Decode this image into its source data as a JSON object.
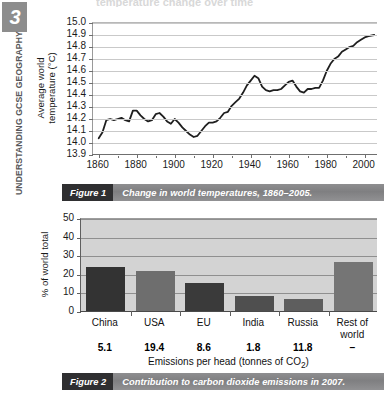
{
  "sidebar": {
    "chapter_number": "3",
    "running_title": "UNDERSTANDING GCSE GEOGRAPHY"
  },
  "top_cut_text": "temperature change over time",
  "figure1": {
    "caption_label": "Figure 1",
    "caption_text": "Change in world temperatures, 1860–2005."
  },
  "figure2": {
    "caption_label": "Figure 2",
    "caption_text": "Contribution to carbon dioxide emissions in 2007."
  },
  "chart_data": [
    {
      "type": "line",
      "title": "Change in world temperatures, 1860–2005.",
      "xlabel": "",
      "ylabel": "Average world temperature (°C)",
      "ylabel_line1": "Average world",
      "ylabel_line2": "temperature (°C)",
      "xlim": [
        1857,
        2007
      ],
      "ylim": [
        13.9,
        15.0
      ],
      "grid": true,
      "grid_axis": "y",
      "legend": false,
      "line_color": "#1f1f1f",
      "xticks": [
        1860,
        1880,
        1900,
        1920,
        1940,
        1960,
        1980,
        2000
      ],
      "xtick_labels": [
        "1860",
        "1880",
        "1900",
        "1920",
        "1940",
        "1960",
        "1980",
        "2000"
      ],
      "yticks": [
        13.9,
        14.0,
        14.1,
        14.2,
        14.3,
        14.4,
        14.5,
        14.6,
        14.7,
        14.8,
        14.9,
        15.0
      ],
      "ytick_labels": [
        "13.9",
        "14.0",
        "14.1",
        "14.2",
        "14.3",
        "14.4",
        "14.5",
        "14.6",
        "14.7",
        "14.8",
        "14.9",
        "15.0"
      ],
      "x": [
        1860,
        1862,
        1864,
        1866,
        1868,
        1870,
        1872,
        1874,
        1876,
        1878,
        1880,
        1882,
        1884,
        1886,
        1888,
        1890,
        1892,
        1894,
        1896,
        1898,
        1900,
        1902,
        1904,
        1906,
        1908,
        1910,
        1912,
        1914,
        1916,
        1918,
        1920,
        1922,
        1924,
        1926,
        1928,
        1930,
        1932,
        1934,
        1936,
        1938,
        1940,
        1942,
        1944,
        1946,
        1948,
        1950,
        1952,
        1954,
        1956,
        1958,
        1960,
        1962,
        1964,
        1966,
        1968,
        1970,
        1972,
        1974,
        1976,
        1978,
        1980,
        1982,
        1984,
        1986,
        1988,
        1990,
        1992,
        1994,
        1996,
        1998,
        2000,
        2002,
        2005
      ],
      "y": [
        14.04,
        14.09,
        14.19,
        14.2,
        14.19,
        14.2,
        14.21,
        14.19,
        14.18,
        14.27,
        14.27,
        14.23,
        14.2,
        14.18,
        14.19,
        14.24,
        14.25,
        14.22,
        14.18,
        14.16,
        14.2,
        14.17,
        14.13,
        14.1,
        14.07,
        14.05,
        14.06,
        14.1,
        14.14,
        14.17,
        14.17,
        14.18,
        14.21,
        14.25,
        14.26,
        14.31,
        14.34,
        14.37,
        14.42,
        14.48,
        14.52,
        14.56,
        14.54,
        14.47,
        14.44,
        14.43,
        14.44,
        14.44,
        14.45,
        14.48,
        14.51,
        14.52,
        14.47,
        14.43,
        14.42,
        14.45,
        14.45,
        14.46,
        14.46,
        14.52,
        14.6,
        14.66,
        14.7,
        14.72,
        14.76,
        14.78,
        14.8,
        14.81,
        14.84,
        14.86,
        14.88,
        14.89,
        14.9
      ]
    },
    {
      "type": "bar",
      "title": "Contribution to carbon dioxide emissions in 2007.",
      "xlabel": "Emissions per head (tonnes of CO₂)",
      "ylabel": "% of world total",
      "ylim": [
        0,
        50
      ],
      "grid": true,
      "grid_axis": "y",
      "legend": false,
      "yticks": [
        0,
        10,
        20,
        30,
        40,
        50
      ],
      "ytick_labels": [
        "0",
        "10",
        "20",
        "30",
        "40",
        "50"
      ],
      "categories": [
        "China",
        "USA",
        "EU",
        "India",
        "Russia",
        "Rest of world"
      ],
      "category_lines": [
        [
          "China"
        ],
        [
          "USA"
        ],
        [
          "EU"
        ],
        [
          "India"
        ],
        [
          "Russia"
        ],
        [
          "Rest of",
          "world"
        ]
      ],
      "values": [
        23.5,
        21.4,
        15.2,
        8.2,
        6.5,
        26.3
      ],
      "bar_colors": [
        "#333333",
        "#6e6e6e",
        "#3a3a3a",
        "#4f4f4f",
        "#5e5e5e",
        "#757575"
      ],
      "secondary_series_name": "Emissions per head (tonnes of CO₂)",
      "secondary_values": [
        "5.1",
        "19.4",
        "8.6",
        "1.8",
        "11.8",
        "–"
      ]
    }
  ]
}
